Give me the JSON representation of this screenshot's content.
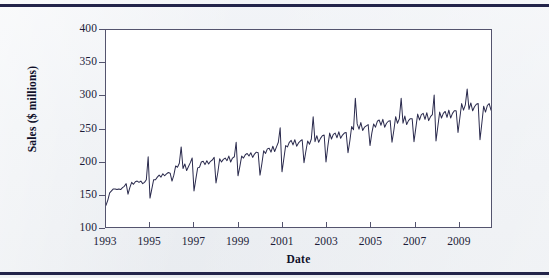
{
  "figure": {
    "background_color": "#eef1f4",
    "rule_color": "#23244a",
    "plot_background": "#ffffff",
    "axis_color": "#54546e"
  },
  "chart_data": {
    "type": "line",
    "title": "",
    "xlabel": "Date",
    "ylabel": "Sales ($ millions)",
    "xlim": [
      1993.0,
      2010.5
    ],
    "ylim": [
      100,
      400
    ],
    "xticks": [
      1993,
      1995,
      1997,
      1999,
      2001,
      2003,
      2005,
      2007,
      2009
    ],
    "xticklabels": [
      "1993",
      "1995",
      "1997",
      "1999",
      "2001",
      "2003",
      "2005",
      "2007",
      "2009"
    ],
    "yticks": [
      100,
      150,
      200,
      250,
      300,
      350,
      400
    ],
    "yticklabels": [
      "100",
      "150",
      "200",
      "250",
      "300",
      "350",
      "400"
    ],
    "grid": false,
    "legend": "none",
    "line_color": "#2a2a4d",
    "line_width": 1,
    "series": [
      {
        "name": "Sales ($ millions)",
        "x_start": 1993.0,
        "x_step": 0.08333333,
        "values": [
          133,
          141,
          152,
          155,
          158,
          158,
          157,
          158,
          157,
          160,
          162,
          166,
          150,
          160,
          168,
          165,
          169,
          170,
          168,
          170,
          166,
          168,
          172,
          207,
          144,
          158,
          172,
          172,
          176,
          179,
          176,
          181,
          178,
          181,
          183,
          182,
          170,
          179,
          193,
          191,
          197,
          222,
          189,
          196,
          186,
          192,
          198,
          205,
          155,
          173,
          190,
          191,
          199,
          200,
          195,
          201,
          196,
          200,
          202,
          206,
          167,
          183,
          204,
          199,
          203,
          205,
          201,
          208,
          199,
          205,
          207,
          229,
          178,
          192,
          208,
          205,
          210,
          212,
          208,
          213,
          206,
          211,
          214,
          213,
          179,
          196,
          216,
          212,
          219,
          220,
          214,
          223,
          215,
          222,
          229,
          251,
          184,
          204,
          224,
          222,
          229,
          232,
          225,
          233,
          223,
          228,
          231,
          233,
          198,
          215,
          231,
          226,
          234,
          268,
          230,
          239,
          229,
          235,
          239,
          240,
          199,
          223,
          243,
          234,
          241,
          243,
          236,
          245,
          235,
          240,
          243,
          244,
          213,
          231,
          253,
          248,
          296,
          257,
          249,
          259,
          247,
          252,
          254,
          256,
          224,
          243,
          257,
          252,
          261,
          263,
          255,
          264,
          252,
          258,
          261,
          262,
          229,
          247,
          268,
          258,
          265,
          296,
          258,
          269,
          256,
          262,
          265,
          265,
          230,
          251,
          272,
          263,
          271,
          273,
          264,
          274,
          262,
          268,
          271,
          301,
          231,
          253,
          275,
          266,
          273,
          276,
          267,
          278,
          266,
          273,
          277,
          277,
          244,
          266,
          288,
          278,
          286,
          310,
          279,
          289,
          277,
          283,
          287,
          288,
          233,
          258,
          284,
          275,
          285,
          288,
          278,
          290,
          276,
          285,
          289,
          328,
          252,
          278,
          300,
          290,
          297,
          300,
          289,
          301,
          287,
          293,
          296,
          296,
          265,
          287,
          312,
          299,
          307,
          356,
          294,
          304,
          291,
          296,
          299,
          299,
          285,
          305,
          331,
          318,
          328,
          373,
          316,
          327,
          311,
          318,
          322,
          322,
          294,
          316,
          342,
          329,
          339,
          339,
          328,
          341,
          324,
          331,
          336,
          384,
          296,
          322,
          348,
          334,
          343,
          346,
          334,
          347,
          330,
          338,
          343,
          343,
          307,
          334,
          362,
          347,
          357,
          394,
          344,
          356,
          338,
          344,
          348,
          348,
          313,
          338,
          351,
          336,
          345,
          348,
          335,
          346,
          328,
          267,
          289,
          291,
          277,
          295,
          313,
          300,
          308,
          311,
          299,
          310,
          296,
          303,
          307,
          309,
          295,
          317,
          341,
          372
        ],
        "n_points": 316,
        "start_label": "1993",
        "end_label": "mid-2010",
        "pattern": "monthly retail sales with strong December seasonal spikes and upward trend",
        "min_value": 133,
        "max_value": 394
      }
    ]
  }
}
